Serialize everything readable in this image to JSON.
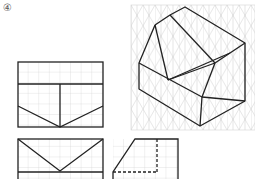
{
  "problem_label": "④",
  "colors": {
    "line": "#222222",
    "grid": "#c8c8c8",
    "background": "#ffffff"
  },
  "views": {
    "front": {
      "name": "front view",
      "grid": "square"
    },
    "top": {
      "name": "top view",
      "grid": "square"
    },
    "side": {
      "name": "side view",
      "grid": "square",
      "hidden_lines": true
    },
    "isometric": {
      "name": "isometric view",
      "grid": "isometric"
    }
  }
}
